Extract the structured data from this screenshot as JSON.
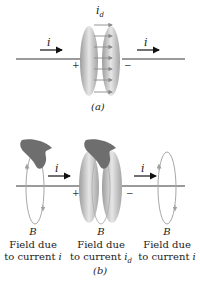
{
  "panel_a": {
    "label": "(a)",
    "current_left": "i",
    "current_right": "i",
    "displacement_current": "i",
    "displacement_sub": "d",
    "plus": "+",
    "minus": "−"
  },
  "panel_b": {
    "label": "(b)",
    "current_left": "i",
    "current_right": "i",
    "plus": "+",
    "minus": "−",
    "captions": [
      {
        "field": "B",
        "line1": "Field due",
        "line2": "to current ",
        "var": "i",
        "sub": ""
      },
      {
        "field": "B",
        "line1": "Field due",
        "line2": "to current ",
        "var": "i",
        "sub": "d"
      },
      {
        "field": "B",
        "line1": "Field due",
        "line2": "to current ",
        "var": "i",
        "sub": ""
      }
    ]
  },
  "colors": {
    "wire": "#9a9a9a",
    "plate": "#b5b5b5",
    "plate_dark": "#8f8f8f",
    "arrow": "#111111",
    "field_loop": "#a8a8a8",
    "hand": "#6e6e6e",
    "dcurrent_arrow": "#8a8a8a"
  }
}
